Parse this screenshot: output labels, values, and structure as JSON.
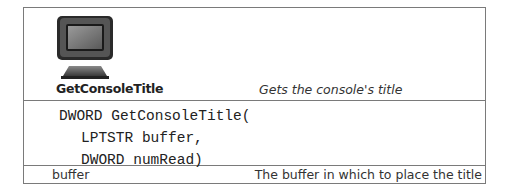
{
  "function": {
    "name": "GetConsoleTitle",
    "description": "Gets the console's title",
    "icon": "console-monitor-icon"
  },
  "signature": {
    "lines": [
      "DWORD GetConsoleTitle(",
      "LPTSTR buffer,",
      "DWORD numRead)"
    ]
  },
  "parameters": [
    {
      "name": "buffer",
      "description": "The buffer in which to place the title"
    }
  ],
  "colors": {
    "border": "#7a7a7a",
    "text": "#222222"
  }
}
